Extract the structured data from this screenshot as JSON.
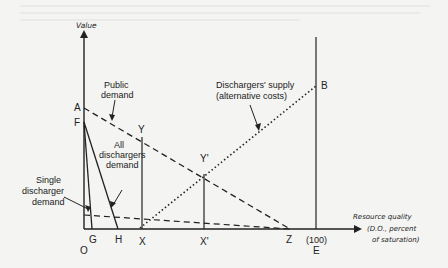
{
  "diagram": {
    "y_axis_label": "Value",
    "x_axis_label": [
      "Resource quality",
      "(D.O., percent",
      "of saturation)"
    ],
    "points": {
      "A": "A",
      "B": "B",
      "F": "F",
      "Y": "Y",
      "Y2": "Y'",
      "O": "O",
      "G": "G",
      "H": "H",
      "X": "X",
      "X2": "X'",
      "Z": "Z",
      "E": "E",
      "E100": "(100)"
    },
    "curve_labels": {
      "public_demand": [
        "Public",
        "demand"
      ],
      "supply": [
        "Dischargers' supply",
        "(alternative costs)"
      ],
      "all_dischargers": [
        "All",
        "dischargers",
        "demand"
      ],
      "single_discharger": [
        "Single",
        "discharger",
        "demand"
      ]
    }
  }
}
